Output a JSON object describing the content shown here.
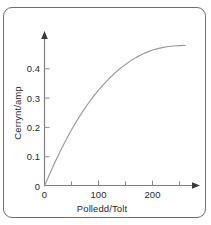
{
  "figure": {
    "frame_color": "#6f6f6f",
    "background": "#ffffff"
  },
  "chart_data": {
    "type": "line",
    "title": "",
    "xlabel": "Polledd/Tolt",
    "ylabel": "Cerrynt/amp",
    "xlabel_intended": "Voltage/volt",
    "ylabel_intended": "Current/amp",
    "xlim": [
      0,
      280
    ],
    "ylim": [
      0,
      0.5
    ],
    "xticks": [
      0,
      100,
      200
    ],
    "xtick_labels": [
      "0",
      "100",
      "200"
    ],
    "x_minor_ticks": [
      50,
      150,
      250
    ],
    "yticks": [
      0,
      0.1,
      0.2,
      0.3,
      0.4
    ],
    "ytick_labels": [
      "0",
      "0.1",
      "0.2",
      "0.3",
      "0.4"
    ],
    "grid": false,
    "legend": "none",
    "series": [
      {
        "name": "current-voltage-characteristic",
        "color": "#9a9a9a",
        "x": [
          0,
          10,
          20,
          30,
          40,
          50,
          60,
          70,
          80,
          90,
          100,
          110,
          120,
          130,
          140,
          150,
          160,
          170,
          180,
          190,
          200,
          210,
          220,
          230,
          240,
          250,
          260
        ],
        "y": [
          0.0,
          0.043,
          0.084,
          0.122,
          0.158,
          0.192,
          0.223,
          0.252,
          0.279,
          0.304,
          0.327,
          0.348,
          0.367,
          0.385,
          0.401,
          0.415,
          0.428,
          0.439,
          0.449,
          0.457,
          0.464,
          0.469,
          0.473,
          0.476,
          0.478,
          0.479,
          0.48
        ]
      }
    ],
    "annotations": []
  },
  "axes": {
    "x_arrow": "arrow-right",
    "y_arrow": "arrow-up",
    "origin_label": "0"
  }
}
